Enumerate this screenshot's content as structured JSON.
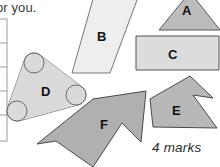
{
  "page": {
    "width": 220,
    "height": 167,
    "background": "#ffffff",
    "prompt_text": "or you.",
    "marks_text": "4 marks"
  },
  "margin_rule": {
    "name": "marks-column-rule",
    "line_color": "#9a9a9a",
    "x": 7,
    "top": 19,
    "bottom": 141,
    "tick_count": 6,
    "tick_ys": [
      19,
      43,
      67,
      91,
      115,
      141
    ]
  },
  "shapes": [
    {
      "id": "A",
      "label": "A",
      "kind": "triangle",
      "fill": "#bcbcbc",
      "stroke": "#5a5a5a",
      "points": "159,30 190,-8 220,30"
    },
    {
      "id": "B",
      "label": "B",
      "kind": "parallelogram",
      "fill": "#eeeeee",
      "stroke": "#777777",
      "points": "95,-8 140,-8 110,73 72,73"
    },
    {
      "id": "C",
      "label": "C",
      "kind": "rectangle",
      "fill": "#dcdcdc",
      "stroke": "#555555",
      "points": "136,36 219,36 219,70 136,70"
    },
    {
      "id": "D",
      "label": "D",
      "kind": "rounded-triangle",
      "fill": "#dadada",
      "stroke": "#6b6b6b",
      "corners": [
        {
          "cx": 34,
          "cy": 63,
          "r": 10
        },
        {
          "cx": 76,
          "cy": 95,
          "r": 10
        },
        {
          "cx": 17,
          "cy": 111,
          "r": 10
        }
      ]
    },
    {
      "id": "E",
      "label": "E",
      "kind": "concave-arrow",
      "fill": "#b8b8b8",
      "stroke": "#4a4a4a",
      "points": "190,76 213,98 193,95 217,128 153,127 150,99"
    },
    {
      "id": "F",
      "label": "F",
      "kind": "chevron-arrow",
      "fill": "#b0b0b0",
      "stroke": "#4a4a4a",
      "points": "146,91 141,142 122,123 93,167 56,141 37,144 93,99"
    }
  ],
  "colors": {
    "page_background": "#ffffff",
    "text": "#3a3a3a",
    "label": "#111111",
    "rule": "#9a9a9a"
  }
}
